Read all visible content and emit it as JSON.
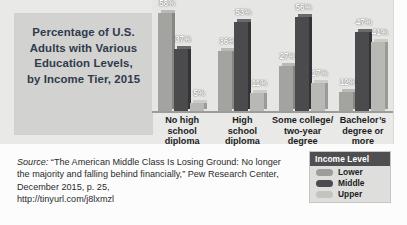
{
  "title": {
    "lines": [
      "Percentage of U.S.",
      "Adults with Various",
      "Education Levels,",
      "by Income Tier, 2015"
    ],
    "full": "Percentage of U.S. Adults with Various Education Levels, by Income Tier, 2015"
  },
  "legend": {
    "title": "Income Level",
    "items": [
      {
        "label": "Lower",
        "color": "#9d9d9a"
      },
      {
        "label": "Middle",
        "color": "#4b4b4e"
      },
      {
        "label": "Upper",
        "color": "#c3c3c0"
      }
    ]
  },
  "source": {
    "label": "Source:",
    "text": " “The American Middle Class Is Losing Ground: No longer the majority and falling behind financially,” Pew Research Center, December 2015, p. 25,",
    "url": "http://tinyurl.com/j8lxmzl"
  },
  "chart_data": {
    "type": "bar",
    "title": "Percentage of U.S. Adults with Various Education Levels, by Income Tier, 2015",
    "xlabel": "",
    "ylabel": "",
    "ylim": [
      0,
      60
    ],
    "grid": false,
    "legend_position": "bottom-right",
    "value_suffix": "%",
    "categories": [
      "No high school diploma",
      "High school diploma",
      "Some college/ two-year degree",
      "Bachelor’s degree or more"
    ],
    "category_lines": [
      [
        "No high",
        "school",
        "diploma"
      ],
      [
        "High",
        "school",
        "diploma"
      ],
      [
        "Some college/",
        "two-year",
        "degree"
      ],
      [
        "Bachelor’s",
        "degree or",
        "more"
      ]
    ],
    "series": [
      {
        "name": "Lower",
        "color": "#a3a3a0",
        "values": [
          58,
          36,
          27,
          12
        ],
        "labels": [
          "58%",
          "36%",
          "27%",
          "12%"
        ]
      },
      {
        "name": "Middle",
        "color": "#4b4b4e",
        "values": [
          37,
          53,
          56,
          47
        ],
        "labels": [
          "37%",
          "53%",
          "56%",
          "47%"
        ]
      },
      {
        "name": "Upper",
        "color": "#b8b8b5",
        "values": [
          5,
          11,
          17,
          41
        ],
        "labels": [
          "5%",
          "11%",
          "17%",
          "41%"
        ]
      }
    ]
  }
}
